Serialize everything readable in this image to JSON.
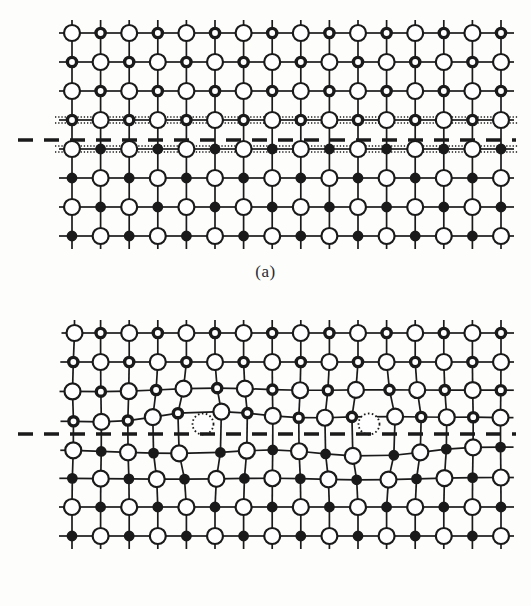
{
  "figure": {
    "background_color": "#fdfdfc",
    "ink_color": "#1a1a1a",
    "width": 531,
    "height": 606
  },
  "panels": [
    {
      "id": "a",
      "label": "(a)",
      "caption": "(a)",
      "description": "Coherent planar interface: undistorted square lattice with a flat boundary plane",
      "interface_type": "flat-coherent",
      "has_vacancies": false,
      "vacancy_count": 0,
      "boundary_band_rows": [
        3,
        4
      ],
      "boundary_band_style": "dotted-hatched"
    },
    {
      "id": "b",
      "label": "(b)",
      "caption": "(b)",
      "description": "Relaxed interface: lattice distorted near the boundary with two vacancies",
      "interface_type": "distorted-relaxed",
      "has_vacancies": true,
      "vacancy_count": 2,
      "boundary_band_rows": [],
      "boundary_band_style": "none"
    }
  ],
  "chart_data": {
    "type": "diagram",
    "grid": {
      "columns": 16,
      "rows": 8,
      "spacing_x": 28.6,
      "spacing_y": 29.0,
      "origin_x": 72,
      "origin_y": 33,
      "stub_length": 13
    },
    "atom_types": [
      {
        "name": "large-open",
        "role": "anion-large",
        "radius": 8.0,
        "fill": "#ffffff",
        "stroke": "#1a1a1a",
        "stroke_width": 2.2
      },
      {
        "name": "small-ring",
        "role": "cation-phase-upper",
        "radius": 4.6,
        "fill": "#ffffff",
        "stroke": "#1a1a1a",
        "stroke_width": 3.4
      },
      {
        "name": "small-filled",
        "role": "cation-phase-lower",
        "radius": 4.6,
        "fill": "#1a1a1a",
        "stroke": "#1a1a1a",
        "stroke_width": 1.6
      },
      {
        "name": "vacancy",
        "role": "vacant-site",
        "radius": 8.5,
        "fill": "none",
        "stroke": "#1a1a1a",
        "stroke_width": 1.8,
        "dash": "1.6 2.4"
      }
    ],
    "phase_split_row": 4,
    "upper_phase_small_atom": "small-ring",
    "lower_phase_small_atom": "small-filled",
    "interface_line": {
      "style": "dashed",
      "color": "#1a1a1a",
      "width": 3.4,
      "dash": "15 11",
      "y_panel_a": 140,
      "y_panel_b": 434,
      "x_start": 18,
      "x_end": 516
    },
    "vacancies": [
      {
        "panel": "b",
        "x": 203,
        "y": 424,
        "r": 10.5
      },
      {
        "panel": "b",
        "x": 369,
        "y": 424,
        "r": 10.5
      }
    ],
    "distortion": {
      "panel": "b",
      "affected_rows": [
        2,
        3,
        4,
        5
      ],
      "max_displacement_px": 14,
      "note": "Bonds near the boundary are bent; rows 3 and 4 show wavy displacement around the two vacancies"
    },
    "axis_ranges": {
      "x": [
        0,
        531
      ],
      "y": [
        0,
        606
      ]
    },
    "grid_on": true,
    "legend_position": "none"
  }
}
